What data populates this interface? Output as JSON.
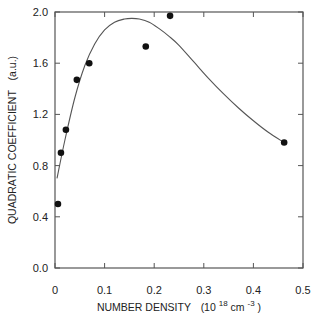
{
  "chart_data": {
    "type": "scatter",
    "title": "",
    "xlabel": "NUMBER DENSITY",
    "xlabel_units_prefix": "(10",
    "xlabel_units_exp": "18",
    "xlabel_units_mid": " cm",
    "xlabel_units_exp2": "-3",
    "xlabel_units_suffix": ")",
    "ylabel": "QUADRATIC COEFFICIENT",
    "ylabel_units": "(a.u.)",
    "xlim": [
      0,
      0.5
    ],
    "ylim": [
      0,
      2.0
    ],
    "x_ticks": [
      0,
      0.1,
      0.2,
      0.3,
      0.4,
      0.5
    ],
    "x_tick_labels": [
      "0",
      "0.1",
      "0.2",
      "0.3",
      "0.4",
      "0.5"
    ],
    "y_ticks": [
      0,
      0.4,
      0.8,
      1.2,
      1.6,
      2.0
    ],
    "y_tick_labels": [
      "0.0",
      "0.4",
      "0.8",
      "1.2",
      "1.6",
      "2.0"
    ],
    "grid": false,
    "legend": "none",
    "series": [
      {
        "name": "measured",
        "style": "markers",
        "color": "#111111",
        "x": [
          0.006,
          0.012,
          0.022,
          0.044,
          0.069,
          0.183,
          0.232,
          0.462
        ],
        "y": [
          0.5,
          0.9,
          1.08,
          1.47,
          1.6,
          1.73,
          1.97,
          0.98
        ]
      },
      {
        "name": "fit",
        "style": "line",
        "color": "#555555",
        "x": [
          0.004,
          0.02,
          0.04,
          0.06,
          0.08,
          0.1,
          0.12,
          0.14,
          0.155,
          0.17,
          0.19,
          0.21,
          0.23,
          0.25,
          0.28,
          0.31,
          0.34,
          0.37,
          0.4,
          0.43,
          0.462
        ],
        "y": [
          0.7,
          1.0,
          1.33,
          1.58,
          1.75,
          1.86,
          1.92,
          1.945,
          1.95,
          1.945,
          1.92,
          1.87,
          1.81,
          1.74,
          1.61,
          1.48,
          1.36,
          1.25,
          1.15,
          1.06,
          0.98
        ]
      }
    ]
  }
}
